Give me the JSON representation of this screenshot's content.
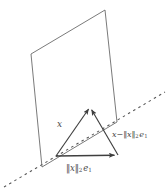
{
  "figure": {
    "background_color": "#ffffff",
    "stroke_color": "#4a4a4a",
    "plane_stroke_color": "#6b6b6b",
    "width": 168,
    "height": 192,
    "labels": {
      "vector_x": "x",
      "vector_difference_prefix": "x",
      "vector_difference_minus": "−",
      "norm_open": "‖",
      "norm_close": "‖",
      "norm_variable": "x",
      "norm_subscript": "2",
      "basis_vector": "e",
      "basis_subscript": "1"
    },
    "geometry": {
      "plane_label": "hyperplane-parallelogram",
      "plane_points": "31,54 105,10 117,122 42,167",
      "dashed_line_label": "axis-dashed-line",
      "dashed_start": [
        4,
        187
      ],
      "dashed_end": [
        165,
        92
      ],
      "origin_point": [
        56,
        156
      ],
      "apex_point": [
        90,
        107
      ],
      "foot_point": [
        118,
        155
      ],
      "dash_pattern": "2.5 3.5"
    },
    "vectors": [
      {
        "name": "vector-x",
        "from": [
          56,
          156
        ],
        "to": [
          90,
          107
        ],
        "label": "x"
      },
      {
        "name": "vector-norm-x-e1",
        "from": [
          56,
          156
        ],
        "to": [
          118,
          155
        ],
        "label": "‖x‖2 e1"
      },
      {
        "name": "vector-x-minus-norm-x-e1",
        "from": [
          118,
          155
        ],
        "to": [
          90,
          107
        ],
        "label": "x − ‖x‖2 e1"
      }
    ]
  }
}
